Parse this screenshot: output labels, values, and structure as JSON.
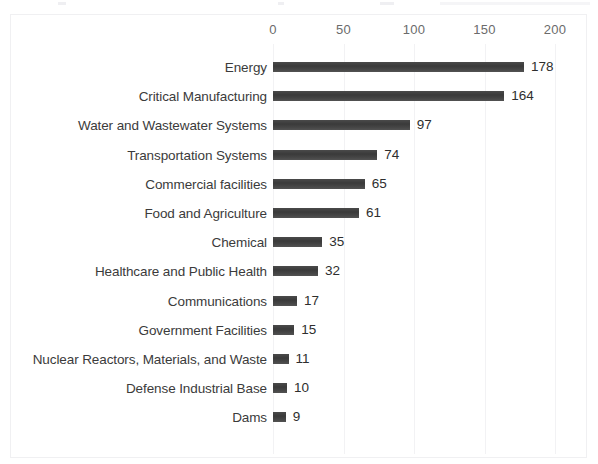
{
  "chart_data": {
    "type": "bar",
    "orientation": "horizontal",
    "title": "",
    "xlabel": "",
    "ylabel": "",
    "xlim": [
      0,
      200
    ],
    "xticks": [
      0,
      50,
      100,
      150,
      200
    ],
    "grid": true,
    "legend": "none",
    "bar_color": "#404040",
    "categories": [
      "Energy",
      "Critical Manufacturing",
      "Water and Wastewater Systems",
      "Transportation Systems",
      "Commercial facilities",
      "Food and Agriculture",
      "Chemical",
      "Healthcare and Public Health",
      "Communications",
      "Government Facilities",
      "Nuclear Reactors, Materials, and Waste",
      "Defense Industrial Base",
      "Dams"
    ],
    "values": [
      178,
      164,
      97,
      74,
      65,
      61,
      35,
      32,
      17,
      15,
      11,
      10,
      9
    ],
    "data_labels": [
      "178",
      "164",
      "97",
      "74",
      "65",
      "61",
      "35",
      "32",
      "17",
      "15",
      "11",
      "10",
      "9"
    ],
    "tick_labels": [
      "0",
      "50",
      "100",
      "150",
      "200"
    ]
  }
}
